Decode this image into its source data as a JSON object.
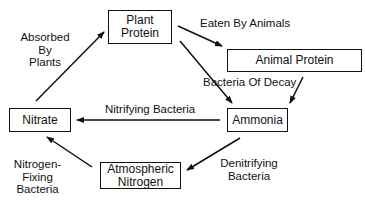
{
  "nodes": {
    "plant_protein": "Plant\nProtein",
    "animal_protein": "Animal Protein",
    "ammonia": "Ammonia",
    "nitrate": "Nitrate",
    "atmospheric_nitrogen": "Atmospheric\nNitrogen"
  },
  "edges": {
    "eaten_by_animals": "Eaten By Animals",
    "bacteria_of_decay": "Bacteria Of Decay",
    "nitrifying_bacteria": "Nitrifying Bacteria",
    "denitrifying_bacteria": "Denitrifying\nBacteria",
    "nitrogen_fixing_bacteria": "Nitrogen-\nFixing\nBacteria",
    "absorbed_by_plants": "Absorbed\nBy\nPlants"
  },
  "colors": {
    "stroke": "#111111",
    "background": "#ffffff"
  }
}
